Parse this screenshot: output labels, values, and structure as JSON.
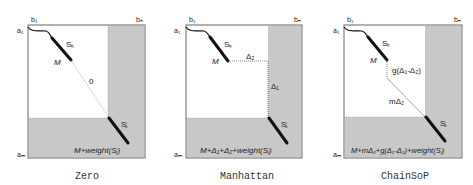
{
  "panels": [
    {
      "caption": "Zero",
      "axis": {
        "b1": "b₁",
        "bn": "bₙ",
        "a1": "a₁",
        "am": "aₘ"
      },
      "segment_labels": {
        "sk": "Sₖ",
        "sj": "Sⱼ",
        "m": "M"
      },
      "path_labels": [
        "0"
      ],
      "result_label": "M+weight(Sⱼ)"
    },
    {
      "caption": "Manhattan",
      "axis": {
        "b1": "b₁",
        "bn": "bₙ",
        "a1": "a₁",
        "am": "aₘ"
      },
      "segment_labels": {
        "sk": "Sₖ",
        "sj": "Sⱼ",
        "m": "M"
      },
      "path_labels": [
        "Δ₂",
        "Δ₁"
      ],
      "result_label": "M+Δ₁+Δ₂+weight(Sⱼ)"
    },
    {
      "caption": "ChainSoP",
      "axis": {
        "b1": "b₁",
        "bn": "bₙ",
        "a1": "a₁",
        "am": "aₘ"
      },
      "segment_labels": {
        "sk": "Sₖ",
        "sj": "Sⱼ",
        "m": "M"
      },
      "path_labels": [
        "g(Δ₁-Δ₂)",
        "mΔ₂"
      ],
      "result_label": "M+mΔ₂+g(Δ₁-Δ₂)+weight(Sⱼ)"
    }
  ],
  "colors": {
    "shade": "#c8c8c8",
    "border": "#888888",
    "segment": "#111111",
    "path": "#555555"
  }
}
